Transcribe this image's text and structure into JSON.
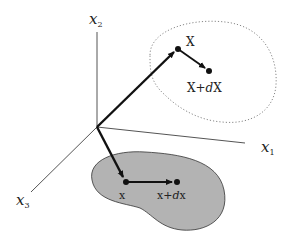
{
  "diagram": {
    "axes": {
      "x1": {
        "base": "x",
        "sub": "1"
      },
      "x2": {
        "base": "x",
        "sub": "2"
      },
      "x3": {
        "base": "x",
        "sub": "3"
      }
    },
    "reference_config": {
      "point_label": "X",
      "neighbor_label_prefix": "X+",
      "neighbor_label_d": "d",
      "neighbor_label_suffix": "X",
      "style": "dotted-outline"
    },
    "current_config": {
      "point_label": "x",
      "neighbor_label_prefix": "x+",
      "neighbor_label_d": "d",
      "neighbor_label_suffix": "x",
      "style": "grey-filled"
    },
    "colors": {
      "fill_region": "#b3b3b3",
      "ink": "#111111",
      "axis": "#555555",
      "dotted": "#888888"
    }
  }
}
